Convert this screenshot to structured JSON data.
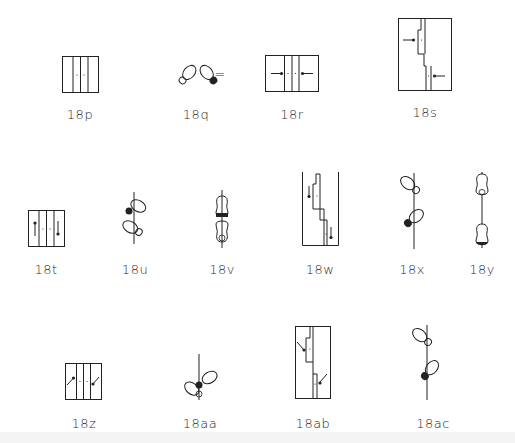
{
  "figures": [
    {
      "id": "18p",
      "label": "18p",
      "kind": "staff-four-columns-dots"
    },
    {
      "id": "18q",
      "label": "18q",
      "kind": "two-feet-heels-together"
    },
    {
      "id": "equals",
      "label": "=",
      "kind": "equals-sign"
    },
    {
      "id": "18r",
      "label": "18r",
      "kind": "staff-arrows-inward"
    },
    {
      "id": "18s",
      "label": "18s",
      "kind": "staggered-staff-arrows-inward"
    },
    {
      "id": "18t",
      "label": "18t",
      "kind": "staff-vertical-pins"
    },
    {
      "id": "18u",
      "label": "18u",
      "kind": "feet-on-line-crossed"
    },
    {
      "id": "18v",
      "label": "18v",
      "kind": "feet-on-line-stacked"
    },
    {
      "id": "18w",
      "label": "18w",
      "kind": "staggered-staff-down-arrows"
    },
    {
      "id": "18x",
      "label": "18x",
      "kind": "feet-on-line-diagonal"
    },
    {
      "id": "18y",
      "label": "18y",
      "kind": "feet-on-line-vertical"
    },
    {
      "id": "18z",
      "label": "18z",
      "kind": "staff-diagonal-pins"
    },
    {
      "id": "18aa",
      "label": "18aa",
      "kind": "feet-on-line-crossed-low"
    },
    {
      "id": "18ab",
      "label": "18ab",
      "kind": "staggered-staff-diagonal-arrows"
    },
    {
      "id": "18ac",
      "label": "18ac",
      "kind": "feet-on-line-diagonal-right"
    }
  ],
  "colors": {
    "ink": "#222222",
    "background": "#ffffff"
  }
}
